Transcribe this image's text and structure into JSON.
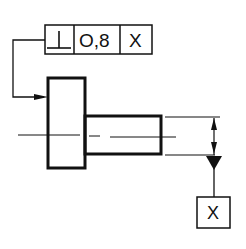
{
  "drawing": {
    "type": "GD&T perpendicularity tolerance drawing",
    "feature_control_frame": {
      "symbol": "⊥",
      "symbol_name": "perpendicularity",
      "tolerance": "O,8",
      "datum_reference": "X"
    },
    "datum_feature": {
      "label": "X"
    },
    "colors": {
      "line": "#111111",
      "background": "#ffffff"
    }
  }
}
